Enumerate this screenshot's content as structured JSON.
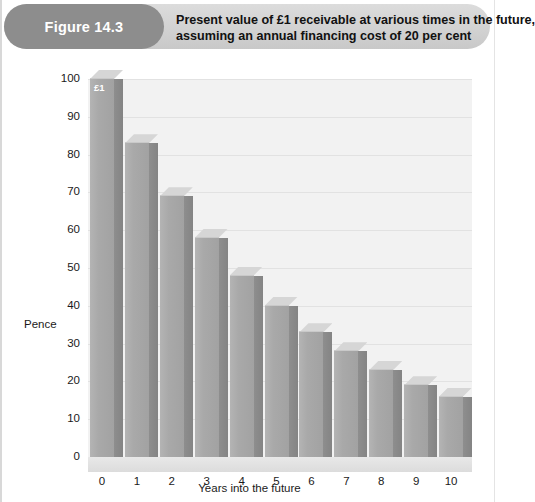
{
  "figure": {
    "label": "Figure 14.3",
    "title_line1": "Present value of £1 receivable at various times in the future,",
    "title_line2": "assuming an annual financing cost of 20 per cent"
  },
  "annotations": {
    "first_bar_tag": "£1"
  },
  "colors": {
    "pill": "#8d8d8d",
    "header_band": "#d2d2d2",
    "bar_face": "#a9a9a9",
    "bar_side": "#8a8a8a",
    "bar_top": "#d6d6d6",
    "plot_bg": "#f2f2f2",
    "gridline": "#e2e2e2"
  },
  "chart_data": {
    "type": "bar",
    "title": "Present value of £1 receivable at various times in the future, assuming an annual financing cost of 20 per cent",
    "xlabel": "Years into the future",
    "ylabel": "Pence",
    "categories": [
      "0",
      "1",
      "2",
      "3",
      "4",
      "5",
      "6",
      "7",
      "8",
      "9",
      "10"
    ],
    "values": [
      100,
      83,
      69,
      58,
      48,
      40,
      33,
      28,
      23,
      19,
      16
    ],
    "yticks": [
      0,
      10,
      20,
      30,
      40,
      50,
      60,
      70,
      80,
      90,
      100
    ],
    "ylim": [
      0,
      100
    ],
    "grid": true,
    "legend": false,
    "style_3d": true,
    "annotation": "£1"
  }
}
